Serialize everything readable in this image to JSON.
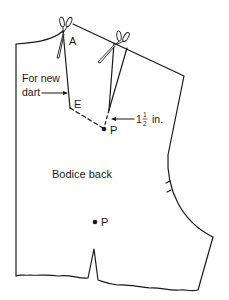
{
  "diagram": {
    "title": "Bodice back",
    "labels": {
      "point_a": "A",
      "point_e": "E",
      "point_p_dart": "P",
      "point_p_lower": "P",
      "new_dart_line1": "For new",
      "new_dart_line2": "dart",
      "measurement_whole": "1",
      "measurement_num": "1",
      "measurement_den": "2",
      "measurement_unit": "in."
    },
    "icons": [
      "scissors-icon-neck",
      "scissors-icon-shoulder"
    ],
    "colors": {
      "line": "#1a1a1a",
      "background": "#ffffff"
    }
  }
}
